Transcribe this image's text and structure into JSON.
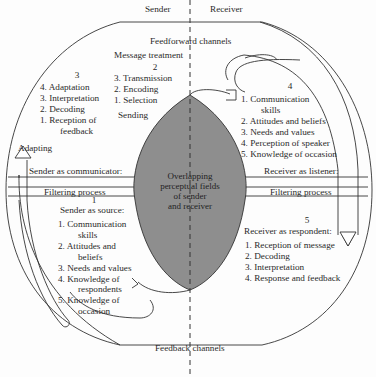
{
  "diagram": {
    "headers": {
      "sender": "Sender",
      "receiver": "Receiver"
    },
    "channels": {
      "feedforward": "Feedforward channels",
      "feedback": "Feedback channels"
    },
    "center": {
      "label_lines": [
        "Overlapping",
        "perceptual fields",
        "of sender",
        "and receiver"
      ],
      "fill_color": "#8e8e8e"
    },
    "stage1": {
      "number": "1",
      "title": "Sender as source:",
      "items": [
        {
          "n": "1.",
          "text": "Communication",
          "cont": "skills"
        },
        {
          "n": "2.",
          "text": "Attitudes and",
          "cont": "beliefs"
        },
        {
          "n": "3.",
          "text": "Needs and values",
          "cont": ""
        },
        {
          "n": "4.",
          "text": "Knowledge of",
          "cont": "respondents"
        },
        {
          "n": "5.",
          "text": "Knowledge of",
          "cont": "occasion"
        }
      ]
    },
    "stage2": {
      "heading": "Message treatment",
      "number": "2",
      "items": [
        {
          "n": "3.",
          "text": "Transmission"
        },
        {
          "n": "2.",
          "text": "Encoding"
        },
        {
          "n": "1.",
          "text": "Selection"
        }
      ],
      "action": "Sending"
    },
    "stage3": {
      "number": "3",
      "items": [
        {
          "n": "4.",
          "text": "Adaptation",
          "cont": ""
        },
        {
          "n": "3.",
          "text": "Interpretation",
          "cont": ""
        },
        {
          "n": "2.",
          "text": "Decoding",
          "cont": ""
        },
        {
          "n": "1.",
          "text": "Reception of",
          "cont": "feedback"
        }
      ],
      "action": "Adapting"
    },
    "stage4": {
      "number": "4",
      "items": [
        {
          "n": "1.",
          "text": "Communication",
          "cont": "skills"
        },
        {
          "n": "2.",
          "text": "Attitudes and beliefs",
          "cont": ""
        },
        {
          "n": "3.",
          "text": "Needs and values",
          "cont": ""
        },
        {
          "n": "4.",
          "text": "Perception of speaker",
          "cont": ""
        },
        {
          "n": "5.",
          "text": "Knowledge of occasion",
          "cont": ""
        }
      ]
    },
    "stage5": {
      "number": "5",
      "title": "Receiver as respondent:",
      "items": [
        {
          "n": "1.",
          "text": "Reception of message"
        },
        {
          "n": "2.",
          "text": "Decoding"
        },
        {
          "n": "3.",
          "text": "Interpretation"
        },
        {
          "n": "4.",
          "text": "Response and feedback"
        }
      ]
    },
    "filters": {
      "sender_role": "Sender as communicator:",
      "receiver_role": "Receiver as listener:",
      "left_process": "Filtering process",
      "right_process": "Filtering process"
    }
  }
}
